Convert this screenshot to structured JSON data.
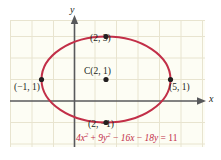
{
  "figure": {
    "kind": "ellipse-graph",
    "background_color": "#ffffff",
    "plot_background_color": "#fdfdf4",
    "grid_color": "#e8e4cf",
    "axis_color": "#58595b",
    "curve_color": "#c22f48",
    "point_color": "#231f20",
    "text_color": "#231f20"
  },
  "axes": {
    "x_label": "x",
    "y_label": "y",
    "grid_visible": true,
    "grid_unit_px": 21.5,
    "x_origin_px": 74,
    "y_origin_px": 101
  },
  "equation": {
    "full": "4x² + 9y² − 16x − 18y = 11",
    "term1_coef": "4",
    "term1_var": "x",
    "term1_exp": "2",
    "op1": " + ",
    "term2_coef": "9",
    "term2_var": "y",
    "term2_exp": "2",
    "op2": " − ",
    "term3": "16x",
    "op3": " − ",
    "term4": "18y",
    "op4": " = ",
    "rhs": "11"
  },
  "ellipse": {
    "center": {
      "x": 2,
      "y": 1
    },
    "semi_major_a": 3,
    "semi_minor_b": 2,
    "center_px": {
      "x": 106,
      "y": 79.5
    },
    "radius_px": {
      "rx": 64.5,
      "ry": 43
    }
  },
  "points": [
    {
      "name": "top-vertex",
      "label": "(2, 3)",
      "x": 2,
      "y": 3,
      "px": 106,
      "py": 36.5
    },
    {
      "name": "center",
      "label": "C(2, 1)",
      "x": 2,
      "y": 1,
      "px": 106,
      "py": 79.5
    },
    {
      "name": "left-vertex",
      "label": "(−1, 1)",
      "x": -1,
      "y": 1,
      "px": 41.5,
      "py": 79.5
    },
    {
      "name": "right-vertex",
      "label": "(5, 1)",
      "x": 5,
      "y": 1,
      "px": 170.5,
      "py": 79.5
    },
    {
      "name": "bottom-vertex",
      "label": "(2, −1)",
      "x": 2,
      "y": -1,
      "px": 106,
      "py": 122.5
    }
  ]
}
